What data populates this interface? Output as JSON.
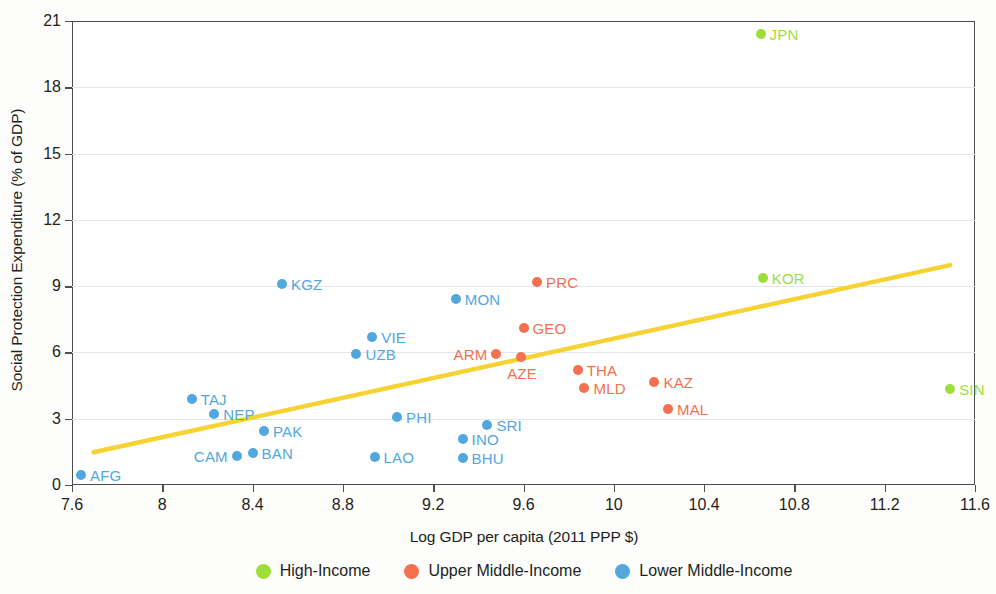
{
  "chart_data": {
    "type": "scatter",
    "title": "",
    "xlabel": "Log GDP per capita (2011 PPP $)",
    "ylabel": "Social Protection Expenditure (% of GDP)",
    "xlim": [
      7.6,
      11.6
    ],
    "ylim": [
      0,
      21
    ],
    "xticks": [
      "7.6",
      "8",
      "8.4",
      "8.8",
      "9.2",
      "9.6",
      "10",
      "10.4",
      "10.8",
      "11.2",
      "11.6"
    ],
    "xtick_values": [
      7.6,
      8,
      8.4,
      8.8,
      9.2,
      9.6,
      10,
      10.4,
      10.8,
      11.2,
      11.6
    ],
    "yticks": [
      "0",
      "3",
      "6",
      "9",
      "12",
      "15",
      "18",
      "21"
    ],
    "ytick_values": [
      0,
      3,
      6,
      9,
      12,
      15,
      18,
      21
    ],
    "grid": "horizontal",
    "legend_position": "bottom-center",
    "colors": {
      "high_income": "#9ede3a",
      "upper_middle_income": "#f4704f",
      "lower_middle_income": "#52a7de",
      "trendline": "#f7d233",
      "gridline": "#e3e6ea",
      "axis": "#4d4d4d",
      "text": "#231f20"
    },
    "series": [
      {
        "name": "High-Income",
        "color": "#9ede3a",
        "points": [
          {
            "code": "JPN",
            "x": 10.65,
            "y": 20.4,
            "label_side": "right"
          },
          {
            "code": "KOR",
            "x": 10.66,
            "y": 9.35,
            "label_side": "right"
          },
          {
            "code": "SIN",
            "x": 11.49,
            "y": 4.35,
            "label_side": "right"
          }
        ]
      },
      {
        "name": "Upper Middle-Income",
        "color": "#f4704f",
        "points": [
          {
            "code": "PRC",
            "x": 9.66,
            "y": 9.2,
            "label_side": "right"
          },
          {
            "code": "GEO",
            "x": 9.6,
            "y": 7.1,
            "label_side": "right"
          },
          {
            "code": "ARM",
            "x": 9.48,
            "y": 5.95,
            "label_side": "left"
          },
          {
            "code": "AZE",
            "x": 9.59,
            "y": 5.8,
            "label_side": "below"
          },
          {
            "code": "THA",
            "x": 9.84,
            "y": 5.2,
            "label_side": "right"
          },
          {
            "code": "MLD",
            "x": 9.87,
            "y": 4.4,
            "label_side": "right"
          },
          {
            "code": "KAZ",
            "x": 10.18,
            "y": 4.65,
            "label_side": "right"
          },
          {
            "code": "MAL",
            "x": 10.24,
            "y": 3.45,
            "label_side": "right"
          }
        ]
      },
      {
        "name": "Lower Middle-Income",
        "color": "#52a7de",
        "points": [
          {
            "code": "KGZ",
            "x": 8.53,
            "y": 9.1,
            "label_side": "right"
          },
          {
            "code": "MON",
            "x": 9.3,
            "y": 8.4,
            "label_side": "right"
          },
          {
            "code": "VIE",
            "x": 8.93,
            "y": 6.7,
            "label_side": "right"
          },
          {
            "code": "UZB",
            "x": 8.86,
            "y": 5.95,
            "label_side": "right"
          },
          {
            "code": "TAJ",
            "x": 8.13,
            "y": 3.9,
            "label_side": "right"
          },
          {
            "code": "NEP",
            "x": 8.23,
            "y": 3.2,
            "label_side": "right"
          },
          {
            "code": "PAK",
            "x": 8.45,
            "y": 2.45,
            "label_side": "right"
          },
          {
            "code": "PHI",
            "x": 9.04,
            "y": 3.1,
            "label_side": "right"
          },
          {
            "code": "SRI",
            "x": 9.44,
            "y": 2.7,
            "label_side": "right"
          },
          {
            "code": "INO",
            "x": 9.33,
            "y": 2.1,
            "label_side": "right"
          },
          {
            "code": "CAM",
            "x": 8.33,
            "y": 1.3,
            "label_side": "left"
          },
          {
            "code": "BAN",
            "x": 8.4,
            "y": 1.45,
            "label_side": "right"
          },
          {
            "code": "LAO",
            "x": 8.94,
            "y": 1.25,
            "label_side": "right"
          },
          {
            "code": "BHU",
            "x": 9.33,
            "y": 1.2,
            "label_side": "right"
          },
          {
            "code": "AFG",
            "x": 7.64,
            "y": 0.45,
            "label_side": "right"
          }
        ]
      }
    ],
    "trendline": {
      "x0": 7.695,
      "y0": 1.48,
      "x1": 11.49,
      "y1": 9.95,
      "color": "#f7d233",
      "width": 4.5
    }
  },
  "legend": {
    "items": [
      {
        "label": "High-Income",
        "color": "#9ede3a"
      },
      {
        "label": "Upper Middle-Income",
        "color": "#f4704f"
      },
      {
        "label": "Lower Middle-Income",
        "color": "#52a7de"
      }
    ]
  }
}
